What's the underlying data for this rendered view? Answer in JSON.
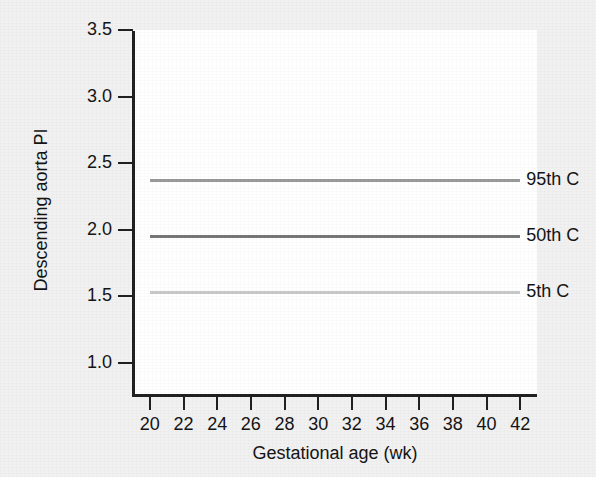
{
  "chart_data": {
    "type": "line",
    "title": "",
    "xlabel": "Gestational age (wk)",
    "ylabel": "Descending aorta PI",
    "xlim": [
      19,
      43
    ],
    "ylim": [
      0.75,
      3.5
    ],
    "grid": false,
    "legend_position": "right-inline",
    "x_ticks": [
      20,
      22,
      24,
      26,
      28,
      30,
      32,
      34,
      36,
      38,
      40,
      42
    ],
    "x_tick_labels": [
      "20",
      "22",
      "24",
      "26",
      "28",
      "30",
      "32",
      "34",
      "36",
      "38",
      "40",
      "42"
    ],
    "y_ticks": [
      1.0,
      1.5,
      2.0,
      2.5,
      3.0,
      3.5
    ],
    "y_tick_labels": [
      "1.0",
      "1.5",
      "2.0",
      "2.5",
      "3.0",
      "3.5"
    ],
    "x": [
      20,
      42
    ],
    "series": [
      {
        "name": "95th C",
        "label": "95th C",
        "color": "#9a9a9a",
        "values": [
          2.37,
          2.37
        ]
      },
      {
        "name": "50th C",
        "label": "50th C",
        "color": "#767676",
        "values": [
          1.95,
          1.95
        ]
      },
      {
        "name": "5th C",
        "label": "5th C",
        "color": "#c9c9c9",
        "values": [
          1.53,
          1.53
        ]
      }
    ]
  },
  "figure": {
    "background_color": "#f1f1f1",
    "plot_background_color": "#ffffff",
    "axis_color": "#202020",
    "text_color": "#141414"
  }
}
